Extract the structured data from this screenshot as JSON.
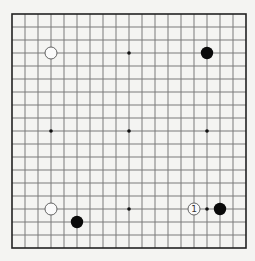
{
  "board": {
    "size": 19,
    "origin_x": 12,
    "origin_y": 14,
    "spacing": 13,
    "line_color": "#7a7a7a",
    "border_color": "#222222",
    "background": "#f4f4f2"
  },
  "hoshi": [
    [
      3,
      3
    ],
    [
      9,
      3
    ],
    [
      15,
      3
    ],
    [
      3,
      9
    ],
    [
      9,
      9
    ],
    [
      15,
      9
    ],
    [
      3,
      15
    ],
    [
      9,
      15
    ],
    [
      15,
      15
    ]
  ],
  "stones": [
    {
      "col": 3,
      "row": 3,
      "color": "white",
      "label": ""
    },
    {
      "col": 15,
      "row": 3,
      "color": "black",
      "label": ""
    },
    {
      "col": 3,
      "row": 15,
      "color": "white",
      "label": ""
    },
    {
      "col": 5,
      "row": 16,
      "color": "black",
      "label": ""
    },
    {
      "col": 14,
      "row": 15,
      "color": "white",
      "label": "1"
    },
    {
      "col": 16,
      "row": 15,
      "color": "black",
      "label": ""
    }
  ]
}
